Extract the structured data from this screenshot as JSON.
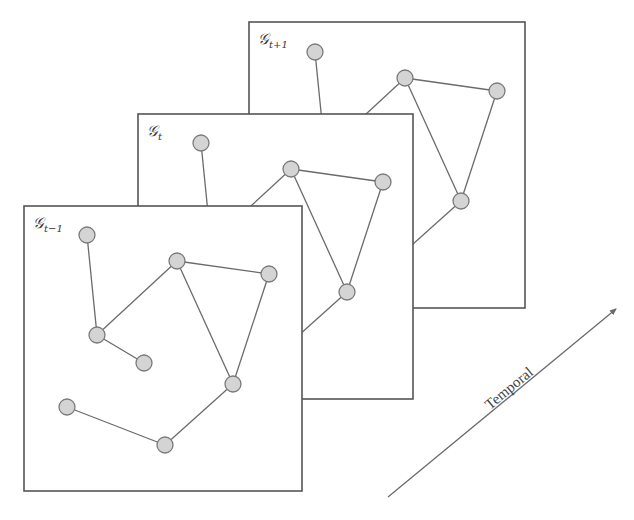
{
  "frames": [
    {
      "id": "back",
      "label_main": "𝒢",
      "label_sub": "t+1"
    },
    {
      "id": "middle",
      "label_main": "𝒢",
      "label_sub": "t"
    },
    {
      "id": "front",
      "label_main": "𝒢",
      "label_sub": "t−1"
    }
  ],
  "graph": {
    "nodes": [
      "a",
      "b",
      "c",
      "d",
      "e",
      "f",
      "g",
      "h"
    ],
    "edges": [
      [
        "a",
        "d"
      ],
      [
        "d",
        "b"
      ],
      [
        "d",
        "e"
      ],
      [
        "b",
        "c"
      ],
      [
        "b",
        "f"
      ],
      [
        "c",
        "f"
      ],
      [
        "f",
        "h"
      ],
      [
        "g",
        "h"
      ]
    ]
  },
  "axis": {
    "label": "Temporal"
  },
  "colors": {
    "node_fill": "#d4d4d4",
    "node_stroke": "#7a7a7a",
    "edge": "#6b6b6b",
    "frame": "#555555"
  }
}
